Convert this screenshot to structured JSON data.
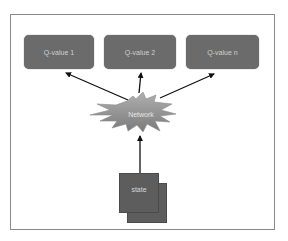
{
  "diagram": {
    "outputs": [
      {
        "label": "Q-value 1"
      },
      {
        "label": "Q-value 2"
      },
      {
        "label": "Q-value n"
      }
    ],
    "network": {
      "label": "Network"
    },
    "input": {
      "label": "state"
    },
    "colors": {
      "box_fill": "#6b6b6b",
      "box_text": "#cfcfcf",
      "network_fill": "#9a9a9a",
      "state_fill": "#5d5d5d",
      "frame_border": "#8a8a8a",
      "arrow": "#111111"
    },
    "edges": [
      {
        "from": "state",
        "to": "Network"
      },
      {
        "from": "Network",
        "to": "Q-value 1"
      },
      {
        "from": "Network",
        "to": "Q-value 2"
      },
      {
        "from": "Network",
        "to": "Q-value n"
      }
    ]
  }
}
